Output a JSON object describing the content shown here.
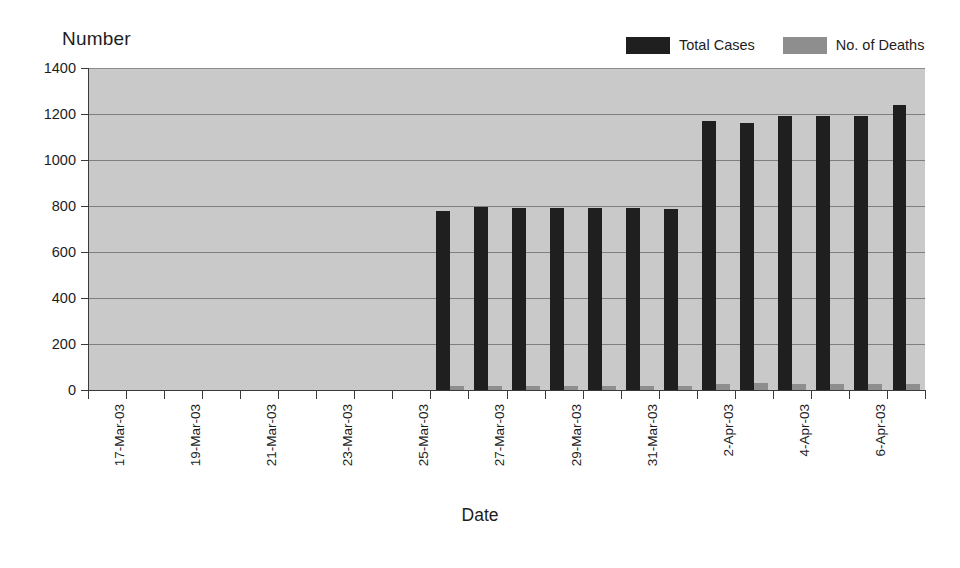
{
  "chart_data": {
    "type": "bar",
    "title": "",
    "subtitle": "",
    "xlabel": "Date",
    "ylabel": "Number",
    "ylim": [
      0,
      1400
    ],
    "ytick_values": [
      0,
      200,
      400,
      600,
      800,
      1000,
      1200,
      1400
    ],
    "ytick_labels": [
      "0",
      "200",
      "400",
      "600",
      "800",
      "1000",
      "1200",
      "1400"
    ],
    "grid": "horizontal",
    "legend_position": "top-right",
    "plot_background": "#c9c9c9",
    "x": [
      "17-Mar-03",
      "18-Mar-03",
      "19-Mar-03",
      "20-Mar-03",
      "21-Mar-03",
      "22-Mar-03",
      "23-Mar-03",
      "24-Mar-03",
      "25-Mar-03",
      "26-Mar-03",
      "27-Mar-03",
      "28-Mar-03",
      "29-Mar-03",
      "30-Mar-03",
      "31-Mar-03",
      "1-Apr-03",
      "2-Apr-03",
      "3-Apr-03",
      "4-Apr-03",
      "5-Apr-03",
      "6-Apr-03",
      "7-Apr-03"
    ],
    "xtick_labels": [
      "17-Mar-03",
      "",
      "19-Mar-03",
      "",
      "21-Mar-03",
      "",
      "23-Mar-03",
      "",
      "25-Mar-03",
      "",
      "27-Mar-03",
      "",
      "29-Mar-03",
      "",
      "31-Mar-03",
      "",
      "2-Apr-03",
      "",
      "4-Apr-03",
      "",
      "6-Apr-03",
      ""
    ],
    "series": [
      {
        "name": "Total Cases",
        "color": "#1f1f1f",
        "values": [
          null,
          null,
          null,
          null,
          null,
          null,
          null,
          null,
          null,
          780,
          795,
          793,
          792,
          792,
          790,
          788,
          1170,
          1163,
          1190,
          1190,
          1190,
          1240
        ]
      },
      {
        "name": "No. of Deaths",
        "color": "#8e8e8e",
        "values": [
          null,
          null,
          null,
          null,
          null,
          null,
          null,
          null,
          null,
          17,
          19,
          17,
          17,
          17,
          17,
          17,
          28,
          29,
          28,
          26,
          26,
          28
        ]
      }
    ]
  },
  "legend": {
    "items": [
      {
        "label": "Total Cases",
        "color": "#1f1f1f"
      },
      {
        "label": "No. of Deaths",
        "color": "#8e8e8e"
      }
    ]
  },
  "axis_titles": {
    "y": "Number",
    "x": "Date"
  }
}
